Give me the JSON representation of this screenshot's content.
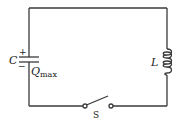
{
  "diagram": {
    "type": "LC circuit",
    "components": {
      "capacitor": {
        "label": "C",
        "plus_sign": "+",
        "minus_sign": "−",
        "charge_label": "Q",
        "charge_subscript": "max"
      },
      "inductor": {
        "label": "L"
      },
      "switch": {
        "label": "S",
        "state": "open"
      }
    },
    "colors": {
      "wire": "#3a3a3a",
      "text": "#222222",
      "background": "#ffffff"
    }
  }
}
